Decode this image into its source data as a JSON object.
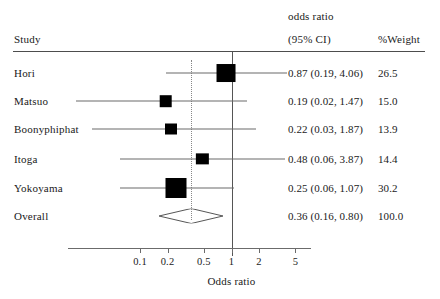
{
  "header": {
    "study_label": "Study",
    "or_label": "odds ratio",
    "ci_label": "(95% CI)",
    "weight_label": "%Weight"
  },
  "axis": {
    "title": "Odds ratio",
    "ticks": [
      "0.1",
      "0.2",
      "0.5",
      "1",
      "2",
      "5"
    ],
    "tick_values": [
      0.1,
      0.2,
      0.5,
      1,
      2,
      5
    ],
    "scale": "log",
    "null_value": 1
  },
  "chart_data": {
    "type": "forest",
    "title": "",
    "xlabel": "Odds ratio",
    "ylabel": "",
    "scale": "log",
    "xlim": [
      0.07,
      8
    ],
    "grid": false,
    "null_line": 1,
    "pooled_line": 0.36,
    "columns": [
      "Study",
      "odds ratio (95% CI)",
      "%Weight"
    ],
    "studies": [
      {
        "name": "Hori",
        "or": 0.87,
        "ci_low": 0.19,
        "ci_high": 4.06,
        "weight": 26.5,
        "estimate_text": "0.87 (0.19, 4.06)",
        "weight_text": "26.5"
      },
      {
        "name": "Matsuo",
        "or": 0.19,
        "ci_low": 0.02,
        "ci_high": 1.47,
        "weight": 15.0,
        "estimate_text": "0.19 (0.02, 1.47)",
        "weight_text": "15.0"
      },
      {
        "name": "Boonyphiphat",
        "or": 0.22,
        "ci_low": 0.03,
        "ci_high": 1.87,
        "weight": 13.9,
        "estimate_text": "0.22 (0.03, 1.87)",
        "weight_text": "13.9"
      },
      {
        "name": "Itoga",
        "or": 0.48,
        "ci_low": 0.06,
        "ci_high": 3.87,
        "weight": 14.4,
        "estimate_text": "0.48 (0.06, 3.87)",
        "weight_text": "14.4"
      },
      {
        "name": "Yokoyama",
        "or": 0.25,
        "ci_low": 0.06,
        "ci_high": 1.07,
        "weight": 30.2,
        "estimate_text": "0.25 (0.06, 1.07)",
        "weight_text": "30.2"
      }
    ],
    "overall": {
      "name": "Overall",
      "or": 0.36,
      "ci_low": 0.16,
      "ci_high": 0.8,
      "weight": 100.0,
      "estimate_text": "0.36 (0.16, 0.80)",
      "weight_text": "100.0"
    }
  },
  "colors": {
    "marker": "#000000",
    "ci_line": "#6b6b6b",
    "rule": "#4d4d4d",
    "pooled_dotted": "#888888",
    "background": "#ffffff",
    "text": "#1a1a1a"
  }
}
